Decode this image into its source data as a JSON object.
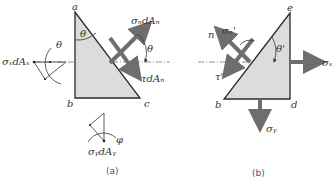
{
  "colors": {
    "fill": "#dcdcdc",
    "edge": "#2a2a2a",
    "arrow": "#6e6e6e",
    "axis": "#777777",
    "text": "#333333"
  },
  "figure_a": {
    "caption": "(a)",
    "vertices": {
      "a": "a",
      "b": "b",
      "c": "c"
    },
    "labels": {
      "sigma_n_dA_n": "σₙdAₙ",
      "tau_dA_n": "τdAₙ",
      "sigma_x_dA_x": "σₓdAₓ",
      "sigma_y_dA_y": "σᵧdAᵧ",
      "theta_top": "θ",
      "theta_right": "θ",
      "theta_left": "θ",
      "phi": "φ"
    }
  },
  "figure_b": {
    "caption": "(b)",
    "vertices": {
      "e": "e",
      "b": "b",
      "d": "d"
    },
    "labels": {
      "n": "n",
      "sigma_n_prime": "σₙ'",
      "tau_prime": "τ'",
      "theta_prime": "θ'",
      "sigma_x": "σₓ",
      "sigma_y": "σᵧ"
    }
  }
}
